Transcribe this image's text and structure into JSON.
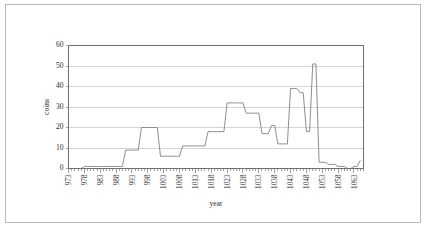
{
  "chart_data": {
    "type": "line",
    "title": "",
    "xlabel": "year",
    "ylabel": "coins",
    "xlim": [
      973,
      1066
    ],
    "ylim": [
      0,
      60
    ],
    "grid": true,
    "legend": null,
    "ytick_labels": [
      "0",
      "10",
      "20",
      "30",
      "40",
      "50",
      "60"
    ],
    "ytick_values": [
      0,
      10,
      20,
      30,
      40,
      50,
      60
    ],
    "xtick_labels": [
      "973",
      "978",
      "983",
      "988",
      "993",
      "998",
      "1003",
      "1008",
      "1013",
      "1018",
      "1023",
      "1028",
      "1033",
      "1038",
      "1043",
      "1048",
      "1053",
      "1058",
      "1063"
    ],
    "xtick_values": [
      973,
      978,
      983,
      988,
      993,
      998,
      1003,
      1008,
      1013,
      1018,
      1023,
      1028,
      1033,
      1038,
      1043,
      1048,
      1053,
      1058,
      1063
    ],
    "series": [
      {
        "name": "coins",
        "color": "#8e8e8e",
        "x": [
          973,
          974,
          975,
          976,
          977,
          978,
          979,
          980,
          981,
          982,
          983,
          984,
          985,
          986,
          987,
          988,
          989,
          990,
          991,
          992,
          993,
          994,
          995,
          996,
          997,
          998,
          999,
          1000,
          1001,
          1002,
          1003,
          1004,
          1005,
          1006,
          1007,
          1008,
          1009,
          1010,
          1011,
          1012,
          1013,
          1014,
          1015,
          1016,
          1017,
          1018,
          1019,
          1020,
          1021,
          1022,
          1023,
          1024,
          1025,
          1026,
          1027,
          1028,
          1029,
          1030,
          1031,
          1032,
          1033,
          1034,
          1035,
          1036,
          1037,
          1038,
          1039,
          1040,
          1041,
          1042,
          1043,
          1044,
          1045,
          1046,
          1047,
          1048,
          1049,
          1050,
          1051,
          1052,
          1053,
          1054,
          1055,
          1056,
          1057,
          1058,
          1059,
          1060,
          1061,
          1062,
          1063,
          1064,
          1065
        ],
        "values": [
          0,
          0,
          0,
          0,
          0,
          1,
          1,
          1,
          1,
          1,
          1,
          1,
          1,
          1,
          1,
          1,
          1,
          1,
          9,
          9,
          9,
          9,
          9,
          20,
          20,
          20,
          20,
          20,
          20,
          6,
          6,
          6,
          6,
          6,
          6,
          6,
          11,
          11,
          11,
          11,
          11,
          11,
          11,
          11,
          18,
          18,
          18,
          18,
          18,
          18,
          32,
          32,
          32,
          32,
          32,
          32,
          27,
          27,
          27,
          27,
          27,
          17,
          17,
          17,
          21,
          21,
          12,
          12,
          12,
          12,
          39,
          39,
          39,
          37,
          37,
          18,
          18,
          51,
          51,
          3,
          3,
          3,
          2,
          2,
          2,
          1,
          1,
          1,
          0,
          0,
          1,
          1,
          4
        ]
      }
    ]
  },
  "labels": {
    "y_axis_title": "coins",
    "x_axis_title": "year"
  }
}
